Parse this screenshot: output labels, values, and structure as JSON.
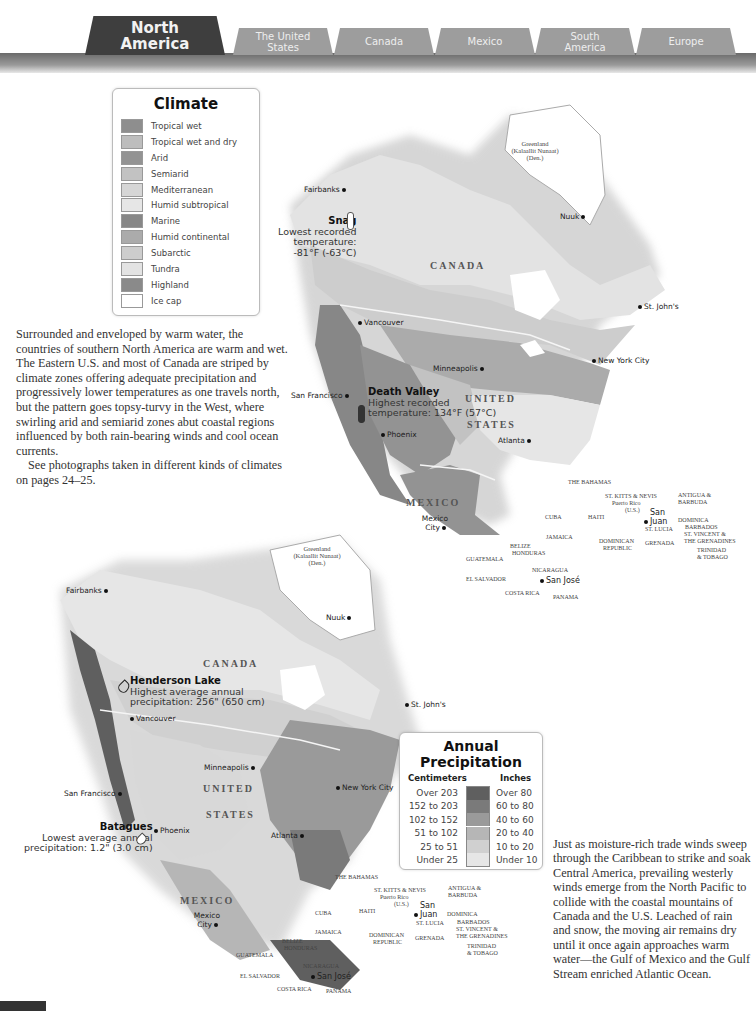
{
  "tabs": [
    {
      "label": "North America",
      "active": true
    },
    {
      "label": "The United States",
      "active": false
    },
    {
      "label": "Canada",
      "active": false
    },
    {
      "label": "Mexico",
      "active": false
    },
    {
      "label": "South America",
      "active": false
    },
    {
      "label": "Europe",
      "active": false
    }
  ],
  "climate_legend": {
    "title": "Climate",
    "items": [
      {
        "label": "Tropical wet",
        "color": "#8e8e8e"
      },
      {
        "label": "Tropical wet and dry",
        "color": "#bdbdbd"
      },
      {
        "label": "Arid",
        "color": "#939393"
      },
      {
        "label": "Semiarid",
        "color": "#c2c2c2"
      },
      {
        "label": "Mediterranean",
        "color": "#d6d6d6"
      },
      {
        "label": "Humid subtropical",
        "color": "#e6e6e6"
      },
      {
        "label": "Marine",
        "color": "#878787"
      },
      {
        "label": "Humid continental",
        "color": "#ababab"
      },
      {
        "label": "Subarctic",
        "color": "#cdcdcd"
      },
      {
        "label": "Tundra",
        "color": "#e3e3e3"
      },
      {
        "label": "Highland",
        "color": "#8a8a8a"
      },
      {
        "label": "Ice cap",
        "color": "#ffffff"
      }
    ]
  },
  "climate_text": {
    "para1": "Surrounded and enveloped by warm water, the countries of southern North America are warm and wet. The Eastern U.S. and most of Canada are striped by climate zones offering adequate precipitation and progressively lower temperatures as one travels north, but the pattern goes topsy-turvy in the West, where swirling arid and semiarid zones abut coastal regions influenced by both rain-bearing winds and cool ocean currents.",
    "para2": "See photographs taken in different kinds of climates on pages 24–25."
  },
  "climate_map": {
    "greenland": [
      "Greenland",
      "(Kalaallit Nunaat)",
      "(Den.)"
    ],
    "cities": {
      "fairbanks": "Fairbanks",
      "nuuk": "Nuuk",
      "st_johns": "St. John's",
      "vancouver": "Vancouver",
      "minneapolis": "Minneapolis",
      "san_francisco": "San Francisco",
      "new_york": "New York City",
      "phoenix": "Phoenix",
      "atlanta": "Atlanta",
      "mexico_city": "Mexico City",
      "san_juan": "San Juan",
      "san_jose": "San José"
    },
    "countries": {
      "canada": "CANADA",
      "united": "UNITED",
      "states": "STATES",
      "mexico": "MEXICO"
    },
    "snag": {
      "title": "Snag",
      "line1": "Lowest recorded",
      "line2": "temperature:",
      "line3": "-81°F (-63°C)"
    },
    "death_valley": {
      "title": "Death Valley",
      "line1": "Highest recorded",
      "line2": "temperature: 134°F (57°C)"
    }
  },
  "caribbean": {
    "bahamas": "THE BAHAMAS",
    "st_kitts": "ST. KITTS & NEVIS",
    "puerto_rico": "Puerto Rico",
    "us": "(U.S.)",
    "antigua": "ANTIGUA &",
    "barbuda": "BARBUDA",
    "cuba": "CUBA",
    "haiti": "HAITI",
    "dominica": "DOMINICA",
    "st_lucia": "ST. LUCIA",
    "barbados": "BARBADOS",
    "st_vincent": "ST. VINCENT &",
    "grenadines": "THE GRENADINES",
    "jamaica": "JAMAICA",
    "dominican": "DOMINICAN",
    "republic": "REPUBLIC",
    "grenada": "GRENADA",
    "trinidad": "TRINIDAD",
    "tobago": "& TOBAGO",
    "belize": "BELIZE",
    "honduras": "HONDURAS",
    "guatemala": "GUATEMALA",
    "nicaragua": "NICARAGUA",
    "el_salvador": "EL SALVADOR",
    "costa_rica": "COSTA RICA",
    "panama": "PANAMA"
  },
  "precip_map": {
    "henderson": {
      "title": "Henderson Lake",
      "line1": "Highest average annual",
      "line2": "precipitation: 256\" (650 cm)"
    },
    "batagues": {
      "title": "Batagues",
      "line1": "Lowest average annual",
      "line2": "precipitation: 1.2\" (3.0 cm)"
    }
  },
  "precip_legend": {
    "title": "Annual Precipitation",
    "cm_header": "Centimeters",
    "in_header": "Inches",
    "rows": [
      {
        "cm": "Over 203",
        "in": "Over 80",
        "color": "#5f5f5f"
      },
      {
        "cm": "152 to 203",
        "in": "60 to 80",
        "color": "#7a7a7a"
      },
      {
        "cm": "102 to 152",
        "in": "40 to 60",
        "color": "#9a9a9a"
      },
      {
        "cm": "51 to 102",
        "in": "20 to 40",
        "color": "#b6b6b6"
      },
      {
        "cm": "25 to 51",
        "in": "10 to 20",
        "color": "#d0d0d0"
      },
      {
        "cm": "Under 25",
        "in": "Under 10",
        "color": "#e6e6e6"
      }
    ]
  },
  "precip_text": "Just as moisture-rich trade winds sweep through the Caribbean to strike and soak Central America, prevailing westerly winds emerge from the North Pacific to collide with the coastal mountains of Canada and the U.S. Leached of rain and snow, the moving air remains dry until it once again approaches warm water—the Gulf of Mexico and the Gulf Stream enriched Atlantic Ocean."
}
